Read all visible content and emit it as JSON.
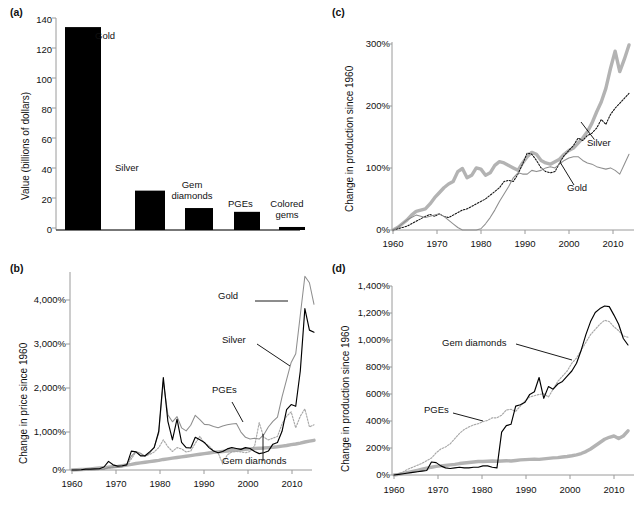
{
  "figure": {
    "panels": [
      "(a)",
      "(b)",
      "(c)",
      "(d)"
    ]
  },
  "chart_data": [
    {
      "panel": "(a)",
      "type": "bar",
      "title": "",
      "xlabel": "",
      "ylabel": "Value (billions of dollars)",
      "ylim": [
        0,
        140
      ],
      "yticks": [
        "0",
        "20",
        "40",
        "60",
        "80",
        "100",
        "120",
        "140"
      ],
      "categories": [
        "Gold",
        "Silver",
        "Gem diamonds",
        "PGEs",
        "Colored gems"
      ],
      "values": [
        134,
        26,
        14.5,
        12,
        2
      ],
      "grid": false,
      "legend": "data-labels-above-bars",
      "bar_labels": [
        "Gold",
        "Silver",
        "Gem\ndiamonds",
        "PGEs",
        "Colored\ngems"
      ]
    },
    {
      "panel": "(b)",
      "type": "line",
      "title": "",
      "xlabel": "",
      "ylabel": "Change in price since 1960",
      "xlim": [
        1960,
        2013
      ],
      "ylim": [
        0,
        4600
      ],
      "yticks": [
        "0%",
        "1,000%",
        "2,000%",
        "3,000%",
        "4,000%"
      ],
      "xticks": [
        "1960",
        "1970",
        "1980",
        "1990",
        "2000",
        "2010"
      ],
      "grid": false,
      "legend": "inline-annotations",
      "annotations": [
        "Gold",
        "Silver",
        "PGEs",
        "Gem diamonds"
      ],
      "x": [
        1960,
        1961,
        1962,
        1963,
        1964,
        1965,
        1966,
        1967,
        1968,
        1969,
        1970,
        1971,
        1972,
        1973,
        1974,
        1975,
        1976,
        1977,
        1978,
        1979,
        1980,
        1981,
        1982,
        1983,
        1984,
        1985,
        1986,
        1987,
        1988,
        1989,
        1990,
        1991,
        1992,
        1993,
        1994,
        1995,
        1996,
        1997,
        1998,
        1999,
        2000,
        2001,
        2002,
        2003,
        2004,
        2005,
        2006,
        2007,
        2008,
        2009,
        2010,
        2011,
        2012,
        2013
      ],
      "series": [
        {
          "name": "Gold",
          "style": "thin-gray-line",
          "values": [
            0,
            0,
            0,
            5,
            5,
            5,
            10,
            15,
            60,
            70,
            60,
            75,
            140,
            320,
            430,
            390,
            320,
            390,
            530,
            860,
            2050,
            1280,
            1120,
            1240,
            980,
            910,
            1040,
            1270,
            1170,
            1060,
            1050,
            1010,
            980,
            1020,
            1050,
            1070,
            1080,
            880,
            760,
            720,
            740,
            720,
            820,
            1000,
            1130,
            1230,
            1700,
            2100,
            2500,
            2700,
            3600,
            4500,
            4350,
            3850
          ]
        },
        {
          "name": "Silver",
          "style": "black-line",
          "values": [
            0,
            0,
            5,
            20,
            20,
            25,
            30,
            70,
            200,
            120,
            90,
            100,
            120,
            440,
            420,
            330,
            330,
            420,
            520,
            900,
            2150,
            1130,
            700,
            1180,
            640,
            520,
            510,
            760,
            700,
            640,
            520,
            440,
            400,
            430,
            490,
            520,
            500,
            480,
            520,
            500,
            430,
            380,
            400,
            440,
            600,
            640,
            900,
            1400,
            1520,
            1480,
            2300,
            3750,
            3250,
            3200
          ]
        },
        {
          "name": "PGEs",
          "style": "dotted-gray-line",
          "values": [
            0,
            0,
            0,
            0,
            0,
            5,
            10,
            20,
            40,
            60,
            70,
            80,
            110,
            260,
            420,
            350,
            330,
            360,
            420,
            520,
            700,
            540,
            430,
            520,
            490,
            420,
            440,
            620,
            780,
            620,
            560,
            450,
            400,
            140,
            350,
            420,
            430,
            420,
            400,
            430,
            560,
            1100,
            760,
            700,
            740,
            780,
            1070,
            1250,
            1350,
            980,
            1250,
            1420,
            1000,
            1050
          ]
        },
        {
          "name": "Gem diamonds",
          "style": "thick-gray-line",
          "values": [
            0,
            5,
            10,
            15,
            25,
            35,
            45,
            55,
            65,
            75,
            85,
            100,
            115,
            130,
            150,
            165,
            180,
            195,
            210,
            225,
            245,
            260,
            275,
            290,
            305,
            320,
            335,
            350,
            365,
            380,
            395,
            410,
            420,
            430,
            440,
            450,
            460,
            470,
            480,
            490,
            500,
            505,
            510,
            520,
            530,
            540,
            555,
            570,
            590,
            605,
            625,
            650,
            670,
            690
          ]
        }
      ]
    },
    {
      "panel": "(c)",
      "type": "line",
      "title": "",
      "xlabel": "",
      "ylabel": "Change in production since 1960",
      "xlim": [
        1960,
        2012
      ],
      "ylim": [
        0,
        320
      ],
      "yticks": [
        "0%",
        "100%",
        "200%",
        "300%"
      ],
      "xticks": [
        "1960",
        "1970",
        "1980",
        "1990",
        "2000",
        "2010"
      ],
      "grid": false,
      "legend": "inline-annotations",
      "annotations": [
        "Silver",
        "Gold"
      ],
      "x": [
        1960,
        1961,
        1962,
        1963,
        1964,
        1965,
        1966,
        1967,
        1968,
        1969,
        1970,
        1971,
        1972,
        1973,
        1974,
        1975,
        1976,
        1977,
        1978,
        1979,
        1980,
        1981,
        1982,
        1983,
        1984,
        1985,
        1986,
        1987,
        1988,
        1989,
        1990,
        1991,
        1992,
        1993,
        1994,
        1995,
        1996,
        1997,
        1998,
        1999,
        2000,
        2001,
        2002,
        2003,
        2004,
        2005,
        2006,
        2007,
        2008,
        2009,
        2010,
        2011
      ],
      "series": [
        {
          "name": "PGEs",
          "style": "thick-gray-line",
          "values": [
            0,
            4,
            10,
            16,
            24,
            30,
            32,
            34,
            42,
            52,
            60,
            68,
            74,
            78,
            94,
            99,
            84,
            88,
            100,
            98,
            88,
            92,
            104,
            110,
            108,
            104,
            100,
            96,
            108,
            118,
            125,
            122,
            112,
            108,
            106,
            110,
            114,
            122,
            128,
            132,
            140,
            148,
            158,
            172,
            190,
            206,
            228,
            260,
            288,
            255,
            275,
            298
          ]
        },
        {
          "name": "Silver",
          "style": "dotted-black-line",
          "values": [
            0,
            2,
            4,
            6,
            10,
            14,
            18,
            22,
            25,
            22,
            26,
            22,
            20,
            24,
            28,
            32,
            34,
            38,
            42,
            46,
            50,
            56,
            62,
            68,
            78,
            80,
            78,
            90,
            106,
            124,
            122,
            112,
            100,
            94,
            92,
            94,
            108,
            120,
            128,
            136,
            148,
            144,
            152,
            156,
            164,
            178,
            170,
            186,
            196,
            204,
            212,
            220
          ]
        },
        {
          "name": "Gold",
          "style": "thin-gray-line",
          "values": [
            0,
            4,
            10,
            16,
            20,
            24,
            22,
            20,
            22,
            24,
            26,
            22,
            16,
            10,
            4,
            0,
            0,
            0,
            0,
            2,
            10,
            20,
            32,
            46,
            58,
            70,
            84,
            92,
            90,
            90,
            96,
            94,
            96,
            100,
            102,
            100,
            106,
            112,
            116,
            118,
            118,
            112,
            108,
            106,
            102,
            100,
            98,
            100,
            96,
            90,
            106,
            122
          ]
        }
      ]
    },
    {
      "panel": "(d)",
      "type": "line",
      "title": "",
      "xlabel": "",
      "ylabel": "Change in production since 1960",
      "xlim": [
        1960,
        2011
      ],
      "ylim": [
        0,
        1500
      ],
      "yticks": [
        "0%",
        "200%",
        "400%",
        "600%",
        "800%",
        "1,000%",
        "1,200%",
        "1,400%"
      ],
      "xticks": [
        "1960",
        "1970",
        "1980",
        "1990",
        "2000",
        "2010"
      ],
      "grid": false,
      "legend": "inline-annotations",
      "annotations": [
        "Gem diamonds",
        "PGEs"
      ],
      "x": [
        1960,
        1961,
        1962,
        1963,
        1964,
        1965,
        1966,
        1967,
        1968,
        1969,
        1970,
        1971,
        1972,
        1973,
        1974,
        1975,
        1976,
        1977,
        1978,
        1979,
        1980,
        1981,
        1982,
        1983,
        1984,
        1985,
        1986,
        1987,
        1988,
        1989,
        1990,
        1991,
        1992,
        1993,
        1994,
        1995,
        1996,
        1997,
        1998,
        1999,
        2000,
        2001,
        2002,
        2003,
        2004,
        2005,
        2006,
        2007,
        2008,
        2009,
        2010
      ],
      "series": [
        {
          "name": "Gem diamonds",
          "style": "black-line",
          "values": [
            0,
            5,
            10,
            15,
            20,
            25,
            30,
            35,
            100,
            95,
            70,
            55,
            50,
            55,
            60,
            55,
            55,
            60,
            60,
            70,
            70,
            60,
            55,
            330,
            380,
            390,
            530,
            540,
            560,
            620,
            640,
            750,
            590,
            680,
            660,
            700,
            720,
            760,
            800,
            860,
            960,
            1080,
            1180,
            1250,
            1280,
            1300,
            1295,
            1230,
            1160,
            1050,
            1000
          ]
        },
        {
          "name": "PGEs",
          "style": "dotted-gray-line",
          "values": [
            0,
            10,
            25,
            45,
            60,
            75,
            90,
            110,
            130,
            170,
            200,
            215,
            240,
            280,
            320,
            350,
            370,
            385,
            395,
            410,
            420,
            440,
            440,
            460,
            500,
            505,
            490,
            530,
            570,
            600,
            610,
            620,
            625,
            600,
            660,
            720,
            760,
            800,
            860,
            900,
            960,
            1020,
            1080,
            1120,
            1160,
            1190,
            1180,
            1140,
            1110,
            1070,
            1060
          ]
        },
        {
          "name": "Colored gems",
          "style": "thick-gray-line",
          "values": [
            0,
            5,
            12,
            20,
            28,
            36,
            44,
            52,
            60,
            66,
            70,
            74,
            78,
            82,
            88,
            92,
            96,
            100,
            104,
            104,
            106,
            108,
            106,
            108,
            110,
            108,
            112,
            116,
            118,
            120,
            122,
            120,
            124,
            128,
            132,
            134,
            138,
            142,
            148,
            155,
            165,
            180,
            200,
            225,
            250,
            275,
            290,
            300,
            280,
            300,
            340
          ]
        }
      ]
    }
  ]
}
